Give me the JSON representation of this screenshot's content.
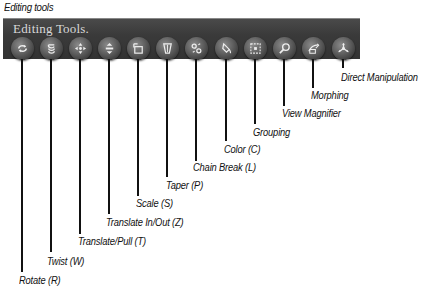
{
  "caption": "Editing tools",
  "toolbar": {
    "title": "Editing Tools.",
    "background": "#3c3c3c",
    "title_color": "#d8d8d8"
  },
  "tools": [
    {
      "label": "Rotate (R)",
      "icon": "rotate-icon",
      "x": 22,
      "line_end": 272,
      "label_x": 19,
      "label_y": 274
    },
    {
      "label": "Twist (W)",
      "icon": "twist-icon",
      "x": 51,
      "line_end": 252,
      "label_x": 47,
      "label_y": 255
    },
    {
      "label": "Translate/Pull (T)",
      "icon": "translate-pull-icon",
      "x": 80,
      "line_end": 234,
      "label_x": 78,
      "label_y": 235
    },
    {
      "label": "Translate In/Out (Z)",
      "icon": "translate-in-out-icon",
      "x": 109,
      "line_end": 214,
      "label_x": 106,
      "label_y": 216
    },
    {
      "label": "Scale (S)",
      "icon": "scale-icon",
      "x": 138,
      "line_end": 196,
      "label_x": 136,
      "label_y": 197
    },
    {
      "label": "Taper (P)",
      "icon": "taper-icon",
      "x": 167,
      "line_end": 177,
      "label_x": 166,
      "label_y": 179
    },
    {
      "label": "Chain Break (L)",
      "icon": "chain-break-icon",
      "x": 196,
      "line_end": 161,
      "label_x": 193,
      "label_y": 161
    },
    {
      "label": "Color (C)",
      "icon": "color-icon",
      "x": 226,
      "line_end": 141,
      "label_x": 224,
      "label_y": 143
    },
    {
      "label": "Grouping",
      "icon": "grouping-icon",
      "x": 255,
      "line_end": 124,
      "label_x": 253,
      "label_y": 126
    },
    {
      "label": "View Magnifier",
      "icon": "magnifier-icon",
      "x": 284,
      "line_end": 106,
      "label_x": 282,
      "label_y": 107
    },
    {
      "label": "Morphing",
      "icon": "morphing-icon",
      "x": 313,
      "line_end": 88,
      "label_x": 311,
      "label_y": 89
    },
    {
      "label": "Direct Manipulation",
      "icon": "direct-manipulation-icon",
      "x": 343,
      "line_end": 68,
      "label_x": 341,
      "label_y": 71
    }
  ]
}
